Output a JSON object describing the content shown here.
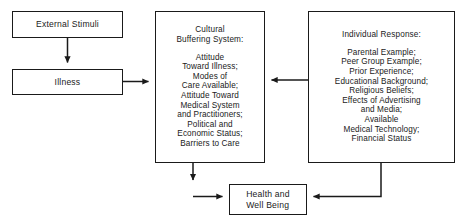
{
  "diagram": {
    "nodes": {
      "external_stimuli": {
        "label": "External Stimuli"
      },
      "illness": {
        "label": "Illness"
      },
      "cultural_buffering_system": {
        "title": "Cultural\nBuffering System:",
        "items": "Attitude\nToward Illness;\nModes of\nCare Available;\nAttitude Toward\nMedical System\nand Practitioners;\nPolitical and\nEconomic Status;\nBarriers to Care"
      },
      "individual_response": {
        "title": "Individual Response:",
        "items": "Parental Example;\nPeer Group Example;\nPrior Experience;\nEducational Background;\nReligious Beliefs;\nEffects of Advertising\nand Media;\nAvailable\nMedical Technology;\nFinancial Status"
      },
      "health_and_well_being": {
        "label": "Health and\nWell Being"
      }
    },
    "edges": [
      {
        "name": "external-stimuli-to-illness",
        "from": "external_stimuli",
        "to": "illness",
        "direction": "down"
      },
      {
        "name": "illness-to-cultural-buffering-system",
        "from": "illness",
        "to": "cultural_buffering_system",
        "direction": "right"
      },
      {
        "name": "individual-response-to-cultural-buffering-system",
        "from": "individual_response",
        "to": "cultural_buffering_system",
        "direction": "left"
      },
      {
        "name": "cultural-buffering-system-to-health-and-well-being",
        "from": "cultural_buffering_system",
        "to": "health_and_well_being",
        "direction": "down-then-right"
      },
      {
        "name": "individual-response-to-health-and-well-being",
        "from": "individual_response",
        "to": "health_and_well_being",
        "direction": "down-then-left"
      }
    ],
    "colors": {
      "stroke": "#1a1a1a",
      "background": "#ffffff",
      "text": "#1a1a1a"
    }
  }
}
